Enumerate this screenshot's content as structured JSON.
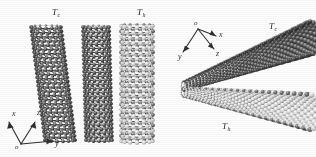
{
  "figure": {
    "type": "scientific-illustration",
    "background_color": "#fdfdfd",
    "atom_color_dark": "#1f1f1f",
    "atom_color_mid": "#555555",
    "atom_color_light": "#e8e8e8",
    "bond_color": "#2a2a2a",
    "width": 316,
    "height": 157
  },
  "panel_left": {
    "name": "side view of parallel nanotubes",
    "labels": {
      "cold": "T",
      "cold_sub": "c",
      "hot": "T",
      "hot_sub": "h"
    },
    "axes": {
      "origin": "o",
      "x": "x",
      "y": "y",
      "z": "z"
    },
    "tubes": [
      {
        "id": "tube-1",
        "temperature_label": "Tc",
        "shade": "dark",
        "tilt_deg": 7
      },
      {
        "id": "tube-2",
        "temperature_label": "",
        "shade": "dark",
        "tilt_deg": 2
      },
      {
        "id": "tube-3",
        "temperature_label": "Th",
        "shade": "light",
        "tilt_deg": 0
      }
    ]
  },
  "panel_right": {
    "name": "perspective view of nanotube bundle",
    "labels": {
      "cold": "T",
      "cold_sub": "c",
      "hot": "T",
      "hot_sub": "h"
    },
    "axes": {
      "origin": "o",
      "x": "x",
      "y": "y",
      "z": "z"
    },
    "tubes": [
      {
        "id": "tube-upper",
        "temperature_label": "Tc",
        "shade": "dark"
      },
      {
        "id": "tube-lower",
        "temperature_label": "Th",
        "shade": "light"
      }
    ]
  }
}
